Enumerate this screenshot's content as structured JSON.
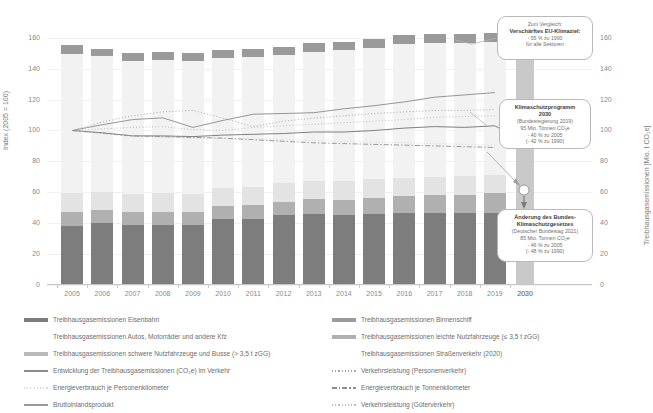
{
  "axes": {
    "y_left_title": "Index (2005 = 100)",
    "y_right_title": "Treibhausgasemissionen [Mio. t CO₂e]",
    "y_ticks": [
      "0",
      "20",
      "40",
      "60",
      "80",
      "100",
      "120",
      "140",
      "160"
    ],
    "x_ticks": [
      "2005",
      "2006",
      "2007",
      "2008",
      "2009",
      "2010",
      "2011",
      "2012",
      "2013",
      "2014",
      "2015",
      "2016",
      "2017",
      "2018",
      "2019",
      "2020"
    ],
    "x_tick_far": "2030"
  },
  "callouts": {
    "eu": {
      "line1": "Zum Vergleich:",
      "line2": "Verschärftes EU-Klimaziel:",
      "line3": "- 55 % zu 1990",
      "line4": "für alle Sektoren"
    },
    "ksp": {
      "line1": "Klimaschutzprogramm",
      "line2": "2030",
      "line3": "(Bundesregierung 2019)",
      "line4": "95 Mio. Tonnen CO₂e",
      "line5": "- 40 % zu 2005",
      "line6": "(- 42 % zu 1990)"
    },
    "bksg": {
      "line1": "Änderung des Bundes-",
      "line2": "Klimaschutzgesetzes",
      "line3": "(Deutscher Bundestag 2021)",
      "line4": "85 Mio. Tonnen CO₂e",
      "line5": "- 46 % zu 2005",
      "line6": "(- 48 % zu 1990)"
    }
  },
  "legend": {
    "left": [
      {
        "label": "Treibhausgasemissionen Eisenbahn",
        "marker": "swatch",
        "color": "#7d7d7d"
      },
      {
        "label": "Treibhausgasemissionen Autos, Motorräder und andere Kfz",
        "marker": "swatch",
        "color": "#f2f2f2"
      },
      {
        "label": "Treibhausgasemissionen schwere Nutzfahrzeuge und Busse (> 3,5 t zGG)",
        "marker": "swatch",
        "color": "#b9b9b9"
      },
      {
        "label": "Entwicklung der Treibhausgasemissionen (CO₂e) im Verkehr",
        "marker": "line",
        "color": "#8c8c8c"
      },
      {
        "label": "Energieverbrauch je Personenkilometer",
        "marker": "dotted",
        "color": "#d8d8d8"
      },
      {
        "label": "Bruttoinlandsprodukt",
        "marker": "line",
        "color": "#9a9a9a"
      }
    ],
    "right": [
      {
        "label": "Treibhausgasemissionen Binnenschiff",
        "marker": "swatch",
        "color": "#9a9a9a"
      },
      {
        "label": "Treibhausgasemissionen leichte Nutzfahrzeuge (≤ 3,5 t zGG)",
        "marker": "swatch",
        "color": "#b0b0b0"
      },
      {
        "label": "Treibhausgasemissionen Straßenverkehr (2020)",
        "marker": "swatch",
        "color": "#e8e8e8"
      },
      {
        "label": "Verkehrsleistung (Personenverkehr)",
        "marker": "dotted",
        "color": "#a9a9a9"
      },
      {
        "label": "Energieverbrauch je Tonnenkilometer",
        "marker": "dashdot",
        "color": "#8e8e8e"
      },
      {
        "label": "Verkehrsleistung (Güterverkehr)",
        "marker": "dotted",
        "color": "#bdbdbd"
      }
    ]
  },
  "chart_data": {
    "type": "bar",
    "title": "",
    "subtitle": "",
    "xlabel": "",
    "ylabel": "Index (2005 = 100)",
    "ylabel_right": "Treibhausgasemissionen [Mio. t CO₂e]",
    "ylim": [
      0,
      165
    ],
    "grid": false,
    "legend_position": "bottom",
    "categories": [
      "2005",
      "2006",
      "2007",
      "2008",
      "2009",
      "2010",
      "2011",
      "2012",
      "2013",
      "2014",
      "2015",
      "2016",
      "2017",
      "2018",
      "2019",
      "2020"
    ],
    "stacked_series": [
      {
        "name": "Treibhausgasemissionen Eisenbahn",
        "color": "#7d7d7d",
        "values": [
          38.5,
          40.0,
          39.0,
          39.0,
          39.0,
          42.5,
          42.8,
          45.0,
          46.0,
          45.0,
          46.0,
          46.5,
          46.5,
          46.5,
          46.5,
          0
        ]
      },
      {
        "name": "Treibhausgasemissionen leichte Nutzfahrzeuge (≤ 3,5 t zGG)",
        "color": "#b0b0b0",
        "values": [
          9.0,
          8.5,
          8.0,
          8.5,
          8.0,
          8.5,
          8.7,
          9.0,
          9.5,
          10.0,
          10.5,
          11.0,
          11.5,
          12.0,
          13.0,
          0
        ]
      },
      {
        "name": "Treibhausgasemissionen schwere Nutzfahrzeuge und Busse (> 3,5 t zGG)",
        "color": "#e3e3e3",
        "values": [
          12.0,
          12.0,
          12.0,
          12.0,
          12.0,
          12.0,
          12.0,
          12.0,
          12.0,
          12.0,
          12.0,
          12.0,
          12.0,
          12.0,
          12.0,
          0
        ]
      },
      {
        "name": "Treibhausgasemissionen Autos, Motorräder und andere Kfz",
        "color": "#f2f2f2",
        "values": [
          90.0,
          87.5,
          86.0,
          86.0,
          86.0,
          84.0,
          84.0,
          83.0,
          83.5,
          85.0,
          85.0,
          86.5,
          86.5,
          86.0,
          85.5,
          0
        ]
      },
      {
        "name": "Treibhausgasemissionen Binnenschiff",
        "color": "#9a9a9a",
        "values": [
          6.0,
          5.0,
          5.0,
          5.0,
          5.0,
          5.0,
          5.0,
          5.0,
          5.5,
          5.5,
          5.5,
          5.5,
          6.0,
          6.0,
          6.0,
          0
        ]
      },
      {
        "name": "Treibhausgasemissionen Straßenverkehr (2020)",
        "color": "#c9c9c9",
        "values": [
          0,
          0,
          0,
          0,
          0,
          0,
          0,
          0,
          0,
          0,
          0,
          0,
          0,
          0,
          0,
          146.0
        ]
      }
    ],
    "bar_totals": [
      155.5,
      153.0,
      150.0,
      150.5,
      150.0,
      152.0,
      152.5,
      154.0,
      156.5,
      157.5,
      159.0,
      161.5,
      162.5,
      162.5,
      163.0,
      146.0
    ],
    "line_series": [
      {
        "name": "Bruttoinlandsprodukt",
        "style": "solid",
        "color": "#8a8a8a",
        "width": 0.9,
        "x": [
          "2005",
          "2006",
          "2007",
          "2008",
          "2009",
          "2010",
          "2011",
          "2012",
          "2013",
          "2014",
          "2015",
          "2016",
          "2017",
          "2018",
          "2019"
        ],
        "values": [
          100,
          103.7,
          107.0,
          108.2,
          102.0,
          106.5,
          110.5,
          111.0,
          111.5,
          114.0,
          116.0,
          118.5,
          121.5,
          123.0,
          124.5
        ]
      },
      {
        "name": "Verkehrsleistung (Personenverkehr)",
        "style": "dotted",
        "color": "#a9a9a9",
        "width": 1.0,
        "x": [
          "2005",
          "2006",
          "2007",
          "2008",
          "2009",
          "2010",
          "2011",
          "2012",
          "2013",
          "2014",
          "2015",
          "2016",
          "2017",
          "2018",
          "2019"
        ],
        "values": [
          100,
          105.5,
          109.5,
          112.0,
          113.0,
          108.0,
          102.5,
          106.0,
          108.0,
          109.5,
          111.0,
          112.0,
          113.0,
          113.0,
          113.5
        ]
      },
      {
        "name": "Verkehrsleistung (Güterverkehr)",
        "style": "dotted",
        "color": "#bdbdbd",
        "width": 1.0,
        "x": [
          "2005",
          "2006",
          "2007",
          "2008",
          "2009",
          "2010",
          "2011",
          "2012",
          "2013",
          "2014",
          "2015",
          "2016",
          "2017",
          "2018",
          "2019"
        ],
        "values": [
          100,
          101.0,
          102.0,
          102.5,
          100.5,
          100.0,
          102.0,
          103.0,
          104.0,
          105.0,
          106.0,
          107.0,
          108.5,
          109.0,
          109.5
        ]
      },
      {
        "name": "Entwicklung der Treibhausgasemissionen (CO₂e) im Verkehr",
        "style": "solid",
        "color": "#7f7f7f",
        "width": 1.0,
        "x": [
          "2005",
          "2006",
          "2007",
          "2008",
          "2009",
          "2010",
          "2011",
          "2012",
          "2013",
          "2014",
          "2015",
          "2016",
          "2017",
          "2018",
          "2019",
          "2020"
        ],
        "values": [
          100,
          98.5,
          96.5,
          96.5,
          96.0,
          97.0,
          97.5,
          98.0,
          99.0,
          99.0,
          100.0,
          101.5,
          102.5,
          102.0,
          103.0,
          92.0
        ]
      },
      {
        "name": "Energieverbrauch je Personenkilometer",
        "style": "dotted",
        "color": "#d5d5d5",
        "width": 1.0,
        "x": [
          "2005",
          "2006",
          "2007",
          "2008",
          "2009",
          "2010",
          "2011",
          "2012",
          "2013",
          "2014",
          "2015",
          "2016",
          "2017",
          "2018",
          "2019"
        ],
        "values": [
          100,
          98.0,
          96.0,
          95.5,
          95.0,
          95.0,
          94.5,
          94.0,
          93.5,
          93.0,
          92.5,
          92.0,
          91.5,
          91.0,
          90.5
        ]
      },
      {
        "name": "Energieverbrauch je Tonnenkilometer",
        "style": "dashdot",
        "color": "#8e8e8e",
        "width": 0.9,
        "x": [
          "2005",
          "2006",
          "2007",
          "2008",
          "2009",
          "2010",
          "2011",
          "2012",
          "2013",
          "2014",
          "2015",
          "2016",
          "2017",
          "2018",
          "2019"
        ],
        "values": [
          100,
          98.2,
          96.5,
          96.0,
          95.5,
          95.0,
          94.0,
          93.0,
          92.0,
          91.5,
          91.0,
          90.5,
          90.0,
          89.5,
          89.0
        ]
      }
    ],
    "target_markers": [
      {
        "name": "Klimaschutzprogramm 2030",
        "x": "2030",
        "value": 95
      },
      {
        "name": "Änderung des Bundes-Klimaschutzgesetzes",
        "x": "2030",
        "value": 85
      }
    ],
    "annotations": [
      "Zum Vergleich: Verschärftes EU-Klimaziel: - 55 % zu 1990 für alle Sektoren",
      "Klimaschutzprogramm 2030 (Bundesregierung 2019) 95 Mio. Tonnen CO₂e - 40 % zu 2005 (- 42 % zu 1990)",
      "Änderung des Bundes-Klimaschutzgesetzes (Deutscher Bundestag 2021) 85 Mio. Tonnen CO₂e - 46 % zu 2005 (- 48 % zu 1990)"
    ]
  }
}
